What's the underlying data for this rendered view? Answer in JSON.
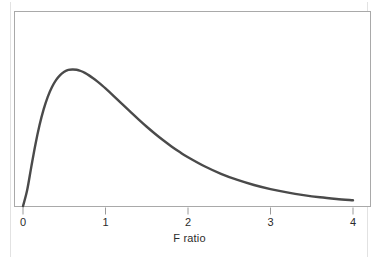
{
  "chart_data": {
    "type": "line",
    "title": "",
    "subtitle": "",
    "xlabel": "F ratio",
    "ylabel": "",
    "xlim": [
      0,
      4
    ],
    "ylim": [
      0,
      1.06
    ],
    "grid": false,
    "legend": null,
    "xticks": [
      "0",
      "1",
      "2",
      "3",
      "4"
    ],
    "xtick_values": [
      0,
      1,
      2,
      3,
      4
    ],
    "yticks": [],
    "annotations": [],
    "series": [
      {
        "name": "F distribution density",
        "color": "#4a4a4a",
        "line_width": 2.4,
        "x": [
          0.0,
          0.05,
          0.1,
          0.15,
          0.2,
          0.25,
          0.3,
          0.35,
          0.4,
          0.45,
          0.5,
          0.55,
          0.6,
          0.65,
          0.7,
          0.75,
          0.8,
          0.85,
          0.9,
          0.95,
          1.0,
          1.1,
          1.2,
          1.3,
          1.4,
          1.5,
          1.6,
          1.7,
          1.8,
          1.9,
          2.0,
          2.2,
          2.4,
          2.6,
          2.8,
          3.0,
          3.2,
          3.4,
          3.6,
          3.8,
          4.0
        ],
        "y": [
          0.0,
          0.116,
          0.286,
          0.45,
          0.592,
          0.708,
          0.8,
          0.87,
          0.922,
          0.959,
          0.983,
          0.997,
          1.0,
          0.998,
          0.989,
          0.975,
          0.957,
          0.936,
          0.913,
          0.888,
          0.862,
          0.806,
          0.748,
          0.691,
          0.635,
          0.581,
          0.53,
          0.482,
          0.437,
          0.396,
          0.358,
          0.292,
          0.237,
          0.192,
          0.155,
          0.125,
          0.101,
          0.081,
          0.065,
          0.053,
          0.043
        ]
      }
    ]
  },
  "axis": {
    "tick_labels": [
      "0",
      "1",
      "2",
      "3",
      "4"
    ],
    "title": "F ratio"
  },
  "style": {
    "curve_color": "#4a4a4a",
    "frame_color": "#a9a9a9",
    "tick_color": "#9a9a9a",
    "text_color": "#2b2b2b",
    "background": "#ffffff"
  }
}
